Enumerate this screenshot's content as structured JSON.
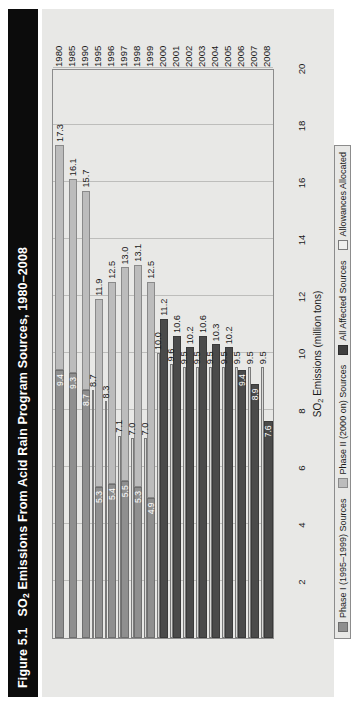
{
  "figure": {
    "number": "Figure 5.1",
    "title_main": "SO",
    "title_sub": "2",
    "title_rest": " Emissions From Acid Rain Program Sources, 1980–2008",
    "title_full": "Figure 5.1   SO2 Emissions From Acid Rain Program Sources, 1980–2008"
  },
  "colors": {
    "title_bar": "#0c0c0c",
    "panel_bg": "#e8e8e6",
    "phase1": "#8f8f8f",
    "phase2": "#bcbcbc",
    "all_affected": "#4a4a4a",
    "allowances": "#d9d9d7",
    "grid": "#bdbdbb",
    "axis": "#8c8c8c"
  },
  "legend": {
    "position": "bottom-left",
    "items": [
      {
        "key": "phase1",
        "label": "Phase I (1995–1999) Sources"
      },
      {
        "key": "phase2",
        "label": "Phase II (2000 on) Sources"
      },
      {
        "key": "all",
        "label": "All Affected Sources"
      },
      {
        "key": "allow",
        "label": "Allowances Allocated"
      }
    ]
  },
  "chart_data": {
    "type": "bar",
    "orientation": "horizontal",
    "stacked": true,
    "title": "SO2 Emissions From Acid Rain Program Sources, 1980–2008",
    "xlabel": "SO2 Emissions (million tons)",
    "ylabel": "",
    "xlim": [
      0,
      20
    ],
    "xticks": [
      2,
      4,
      6,
      8,
      10,
      12,
      14,
      16,
      18,
      20
    ],
    "grid": true,
    "categories": [
      "1980",
      "1985",
      "1990",
      "1995",
      "1996",
      "1997",
      "1998",
      "1999",
      "2000",
      "2001",
      "2002",
      "2003",
      "2004",
      "2005",
      "2006",
      "2007",
      "2008"
    ],
    "series": [
      {
        "name": "Phase I (1995–1999) Sources",
        "values": [
          9.4,
          9.3,
          8.7,
          5.3,
          5.4,
          5.5,
          5.3,
          4.9,
          null,
          null,
          null,
          null,
          null,
          null,
          null,
          null,
          null
        ]
      },
      {
        "name": "Phase II (2000 on) Sources",
        "values": [
          7.9,
          6.8,
          7.0,
          6.6,
          7.1,
          7.5,
          7.8,
          7.6,
          null,
          null,
          null,
          null,
          null,
          null,
          null,
          null,
          null
        ]
      },
      {
        "name": "All Affected Sources",
        "values": [
          null,
          null,
          null,
          null,
          null,
          null,
          null,
          null,
          11.2,
          10.6,
          10.2,
          10.6,
          10.3,
          10.2,
          9.4,
          8.9,
          7.6
        ]
      },
      {
        "name": "Allowances Allocated",
        "values": [
          null,
          null,
          null,
          8.7,
          8.3,
          7.1,
          7.0,
          7.0,
          10.0,
          9.6,
          9.5,
          9.5,
          9.5,
          9.5,
          9.5,
          9.5,
          9.5
        ]
      }
    ],
    "totals": [
      17.3,
      16.1,
      15.7,
      11.9,
      12.5,
      13.0,
      13.1,
      12.5,
      11.2,
      10.6,
      10.2,
      10.6,
      10.3,
      10.2,
      9.4,
      8.9,
      7.6
    ],
    "rows": [
      {
        "year": "1980",
        "total": 17.3,
        "total_label": "17.3",
        "phase1": 9.4,
        "phase1_label": "9.4",
        "phase2_end": 17.3,
        "allowances": null,
        "allow_label": null,
        "all_affected": null,
        "all_label": null
      },
      {
        "year": "1985",
        "total": 16.1,
        "total_label": "16.1",
        "phase1": 9.3,
        "phase1_label": "9.3",
        "phase2_end": 16.1,
        "allowances": null,
        "allow_label": null,
        "all_affected": null,
        "all_label": null
      },
      {
        "year": "1990",
        "total": 15.7,
        "total_label": "15.7",
        "phase1": 8.7,
        "phase1_label": "8.7",
        "phase2_end": 15.7,
        "allowances": null,
        "allow_label": null,
        "all_affected": null,
        "all_label": null
      },
      {
        "year": "1995",
        "total": 11.9,
        "total_label": "11.9",
        "phase1": 5.3,
        "phase1_label": "5.3",
        "phase2_end": 11.9,
        "allowances": 8.7,
        "allow_label": "8.7",
        "all_affected": null,
        "all_label": null
      },
      {
        "year": "1996",
        "total": 12.5,
        "total_label": "12.5",
        "phase1": 5.4,
        "phase1_label": "5.4",
        "phase2_end": 12.5,
        "allowances": 8.3,
        "allow_label": "8.3",
        "all_affected": null,
        "all_label": null
      },
      {
        "year": "1997",
        "total": 13.0,
        "total_label": "13.0",
        "phase1": 5.5,
        "phase1_label": "5.5",
        "phase2_end": 13.0,
        "allowances": 7.1,
        "allow_label": "7.1",
        "all_affected": null,
        "all_label": null
      },
      {
        "year": "1998",
        "total": 13.1,
        "total_label": "13.1",
        "phase1": 5.3,
        "phase1_label": "5.3",
        "phase2_end": 13.1,
        "allowances": 7.0,
        "allow_label": "7.0",
        "all_affected": null,
        "all_label": null
      },
      {
        "year": "1999",
        "total": 12.5,
        "total_label": "12.5",
        "phase1": 4.9,
        "phase1_label": "4.9",
        "phase2_end": 12.5,
        "allowances": 7.0,
        "allow_label": "7.0",
        "all_affected": null,
        "all_label": null
      },
      {
        "year": "2000",
        "total": 11.2,
        "total_label": "11.2",
        "phase1": null,
        "phase1_label": null,
        "phase2_end": null,
        "allowances": 10.0,
        "allow_label": "10.0",
        "all_affected": 11.2,
        "all_label": null
      },
      {
        "year": "2001",
        "total": 10.6,
        "total_label": "10.6",
        "phase1": null,
        "phase1_label": null,
        "phase2_end": null,
        "allowances": 9.6,
        "allow_label": "9.6",
        "all_affected": 10.6,
        "all_label": null
      },
      {
        "year": "2002",
        "total": 10.2,
        "total_label": "10.2",
        "phase1": null,
        "phase1_label": null,
        "phase2_end": null,
        "allowances": 9.5,
        "allow_label": "9.5",
        "all_affected": 10.2,
        "all_label": null
      },
      {
        "year": "2003",
        "total": 10.6,
        "total_label": "10.6",
        "phase1": null,
        "phase1_label": null,
        "phase2_end": null,
        "allowances": 9.5,
        "allow_label": "9.5",
        "all_affected": 10.6,
        "all_label": null
      },
      {
        "year": "2004",
        "total": 10.3,
        "total_label": "10.3",
        "phase1": null,
        "phase1_label": null,
        "phase2_end": null,
        "allowances": 9.5,
        "allow_label": "9.5",
        "all_affected": 10.3,
        "all_label": null
      },
      {
        "year": "2005",
        "total": 10.2,
        "total_label": "10.2",
        "phase1": null,
        "phase1_label": null,
        "phase2_end": null,
        "allowances": 9.5,
        "allow_label": "9.5",
        "all_affected": 10.2,
        "all_label": null
      },
      {
        "year": "2006",
        "total": 9.4,
        "total_label": null,
        "phase1": null,
        "phase1_label": null,
        "phase2_end": null,
        "allowances": 9.5,
        "allow_label": "9.5",
        "all_affected": 9.4,
        "all_label": "9.4"
      },
      {
        "year": "2007",
        "total": 8.9,
        "total_label": null,
        "phase1": null,
        "phase1_label": null,
        "phase2_end": null,
        "allowances": 9.5,
        "allow_label": "9.5",
        "all_affected": 8.9,
        "all_label": "8.9"
      },
      {
        "year": "2008",
        "total": 7.6,
        "total_label": null,
        "phase1": null,
        "phase1_label": null,
        "phase2_end": null,
        "allowances": 9.5,
        "allow_label": "9.5",
        "all_affected": 7.6,
        "all_label": "7.6"
      }
    ]
  }
}
